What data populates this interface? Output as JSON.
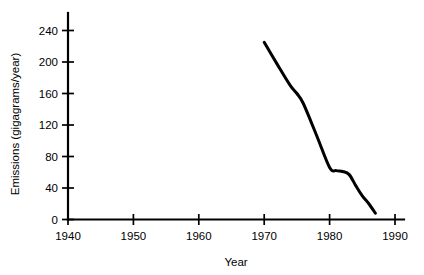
{
  "chart_data": {
    "type": "line",
    "title": "",
    "xlabel": "Year",
    "ylabel": "Emissions (gigagrams/year)",
    "xlim": [
      1940,
      1991
    ],
    "ylim": [
      0,
      252
    ],
    "xticks": [
      1940,
      1950,
      1960,
      1970,
      1980,
      1990
    ],
    "xtick_labels": [
      "1940",
      "1950",
      "1960",
      "1970",
      "1980",
      "1990"
    ],
    "yticks": [
      0,
      40,
      80,
      120,
      160,
      200,
      240
    ],
    "ytick_labels": [
      "0",
      "40",
      "80",
      "120",
      "160",
      "200",
      "240"
    ],
    "grid": false,
    "legend": null,
    "series": [
      {
        "name": "Emissions",
        "x": [
          1970,
          1972,
          1974,
          1975,
          1976,
          1978,
          1980,
          1981,
          1982,
          1983,
          1984,
          1985,
          1986,
          1987
        ],
        "values": [
          225,
          197,
          170,
          160,
          147,
          107,
          66,
          62,
          61,
          57,
          43,
          30,
          20,
          8
        ]
      }
    ],
    "colors": {
      "line": "#000000",
      "axis": "#000000",
      "background": "#ffffff"
    }
  },
  "labels": {
    "x_axis_title": "Year",
    "y_axis_title": "Emissions (gigagrams/year)"
  }
}
